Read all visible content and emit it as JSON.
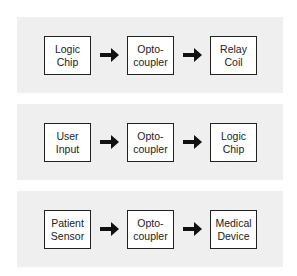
{
  "diagram": {
    "panels": [
      {
        "blocks": [
          {
            "line1": "Logic",
            "line2": "Chip"
          },
          {
            "line1": "Opto-",
            "line2": "coupler"
          },
          {
            "line1": "Relay",
            "line2": "Coil"
          }
        ]
      },
      {
        "blocks": [
          {
            "line1": "User",
            "line2": "Input"
          },
          {
            "line1": "Opto-",
            "line2": "coupler"
          },
          {
            "line1": "Logic",
            "line2": "Chip"
          }
        ]
      },
      {
        "blocks": [
          {
            "line1": "Patient",
            "line2": "Sensor"
          },
          {
            "line1": "Opto-",
            "line2": "coupler"
          },
          {
            "line1": "Medical",
            "line2": "Device"
          }
        ]
      }
    ],
    "arrow_icon": "right-arrow-icon",
    "colors": {
      "panel_bg": "#efefef",
      "box_border": "#222222",
      "arrow": "#111111"
    }
  }
}
